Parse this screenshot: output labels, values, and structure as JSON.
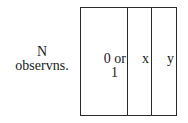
{
  "row_label": {
    "line1": "N",
    "line2": "observns."
  },
  "columns": [
    {
      "line1": "0 or",
      "line2": "1"
    },
    {
      "line1": "x"
    },
    {
      "line1": "y"
    }
  ]
}
